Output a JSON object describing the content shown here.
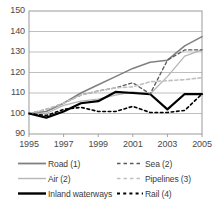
{
  "chart_data": {
    "type": "line",
    "title": "",
    "subtitle": "",
    "xlabel": "",
    "ylabel": "",
    "x": [
      1995,
      1996,
      1997,
      1998,
      1999,
      2000,
      2001,
      2002,
      2003,
      2004,
      2005
    ],
    "xlim": [
      1995,
      2005
    ],
    "ylim": [
      90,
      150
    ],
    "yticks": [
      90,
      100,
      110,
      120,
      130,
      140,
      150
    ],
    "xticks": [
      1995,
      1997,
      1999,
      2001,
      2003,
      2005
    ],
    "grid": "horizontal",
    "legend_position": "bottom",
    "legend_columns": 2,
    "series": [
      {
        "name": "Road (1)",
        "style": "solid",
        "color": "#808080",
        "width": 1.6,
        "values": [
          100,
          101,
          105,
          110,
          114,
          118,
          122,
          125,
          126,
          133,
          137.5
        ]
      },
      {
        "name": "Air (2)",
        "style": "solid",
        "color": "#b5b5b5",
        "width": 1.3,
        "values": [
          100,
          100,
          104,
          106,
          107,
          109,
          110.5,
          109.5,
          118,
          128,
          131
        ]
      },
      {
        "name": "Inland waterways",
        "style": "solid",
        "color": "#000000",
        "width": 2.2,
        "values": [
          100,
          98,
          101,
          105,
          106,
          110.5,
          110,
          109.5,
          102,
          109.5,
          109.5
        ]
      },
      {
        "name": "Sea (2)",
        "style": "dashed",
        "color": "#5a5a5a",
        "width": 1.3,
        "values": [
          100,
          102,
          105,
          109,
          111,
          112.5,
          115,
          109.5,
          126,
          131,
          131
        ]
      },
      {
        "name": "Pipelines (3)",
        "style": "dashed",
        "color": "#c0c0c0",
        "width": 1.6,
        "values": [
          100,
          102,
          105,
          109,
          111,
          112.5,
          113,
          115.5,
          116,
          116.5,
          117.5
        ]
      },
      {
        "name": "Rail (4)",
        "style": "dashdot",
        "color": "#000000",
        "width": 1.6,
        "values": [
          100,
          99,
          102,
          103,
          101,
          101,
          103.5,
          100.5,
          100.5,
          101.5,
          109.5
        ]
      }
    ]
  },
  "axis": {
    "ytick_labels": [
      "150",
      "140",
      "130",
      "120",
      "110",
      "100",
      "90"
    ],
    "xtick_labels": [
      "1995",
      "1997",
      "1999",
      "2001",
      "2003",
      "2005"
    ]
  },
  "legend": {
    "left_column": [
      {
        "label": "Road (1)",
        "swatch": "solid-medium-gray"
      },
      {
        "label": "Air (2)",
        "swatch": "solid-light-gray"
      },
      {
        "label": "Inland waterways",
        "swatch": "solid-black-thick"
      }
    ],
    "right_column": [
      {
        "label": "Sea (2)",
        "swatch": "dashed-dark-gray"
      },
      {
        "label": "Pipelines (3)",
        "swatch": "dashed-light-gray"
      },
      {
        "label": "Rail (4)",
        "swatch": "dashdot-black"
      }
    ]
  },
  "colors": {
    "road": "#808080",
    "air": "#b5b5b5",
    "inland_waterways": "#000000",
    "sea": "#5a5a5a",
    "pipelines": "#c0c0c0",
    "rail": "#000000",
    "grid": "#b8b8b8",
    "axis": "#9a9a9a",
    "text": "#3a3a3a",
    "background": "#ffffff"
  }
}
